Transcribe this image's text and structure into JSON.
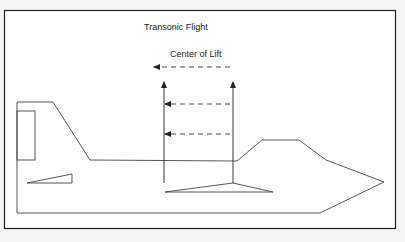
{
  "title": "Transonic Flight",
  "annotation": "Center of Lift",
  "colors": {
    "background": "#f5f5f5",
    "frame_fill": "#ffffff",
    "frame_stroke": "#222222",
    "line": "#333333",
    "dashed": "#333333"
  },
  "elements": {
    "lift_arrows": 2,
    "center_of_lift_shift_arrows": 3
  }
}
